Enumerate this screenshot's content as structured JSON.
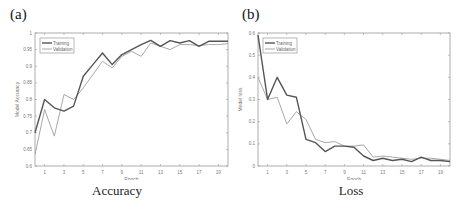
{
  "chart_data": [
    {
      "type": "line",
      "panel_label": "(a)",
      "caption": "Accuracy",
      "title": "",
      "xlabel": "Epoch",
      "ylabel": "Model Accuracy",
      "xlim": [
        0,
        20
      ],
      "ylim": [
        0.6,
        1.0
      ],
      "xticks": [
        1,
        3,
        5,
        7,
        9,
        11,
        13,
        15,
        17,
        19
      ],
      "yticks": [
        0.6,
        0.65,
        0.7,
        0.75,
        0.8,
        0.85,
        0.9,
        0.95,
        1
      ],
      "ytick_labels": [
        "0.6",
        "0.65",
        "0.7",
        "0.75",
        "0.8",
        "0.85",
        "0.9",
        "0.95",
        "1"
      ],
      "grid": false,
      "legend_position": "upper left",
      "x": [
        0,
        1,
        2,
        3,
        4,
        5,
        6,
        7,
        8,
        9,
        10,
        11,
        12,
        13,
        14,
        15,
        16,
        17,
        18,
        19,
        20
      ],
      "series": [
        {
          "name": "Training",
          "color": "#555555",
          "values": [
            0.7,
            0.8,
            0.775,
            0.765,
            0.78,
            0.87,
            0.905,
            0.94,
            0.905,
            0.935,
            0.95,
            0.965,
            0.978,
            0.96,
            0.977,
            0.97,
            0.977,
            0.96,
            0.975,
            0.975,
            0.975
          ]
        },
        {
          "name": "Validation",
          "color": "#a8a8a8",
          "values": [
            0.635,
            0.77,
            0.69,
            0.815,
            0.8,
            0.835,
            0.875,
            0.915,
            0.895,
            0.93,
            0.945,
            0.93,
            0.97,
            0.96,
            0.95,
            0.965,
            0.965,
            0.962,
            0.965,
            0.965,
            0.968
          ]
        }
      ]
    },
    {
      "type": "line",
      "panel_label": "(b)",
      "caption": "Loss",
      "title": "",
      "xlabel": "Epoch",
      "ylabel": "Model loss",
      "xlim": [
        0,
        20
      ],
      "ylim": [
        0,
        0.6
      ],
      "xticks": [
        1,
        3,
        5,
        7,
        9,
        11,
        13,
        15,
        17,
        19
      ],
      "yticks": [
        0,
        0.1,
        0.2,
        0.3,
        0.4,
        0.5,
        0.6
      ],
      "ytick_labels": [
        "0",
        "0.1",
        "0.2",
        "0.3",
        "0.4",
        "0.5",
        "0.6"
      ],
      "grid": false,
      "legend_position": "upper left",
      "x": [
        0,
        1,
        2,
        3,
        4,
        5,
        6,
        7,
        8,
        9,
        10,
        11,
        12,
        13,
        14,
        15,
        16,
        17,
        18,
        19,
        20
      ],
      "series": [
        {
          "name": "Training",
          "color": "#555555",
          "values": [
            0.59,
            0.3,
            0.4,
            0.32,
            0.31,
            0.12,
            0.105,
            0.065,
            0.09,
            0.09,
            0.085,
            0.045,
            0.025,
            0.035,
            0.025,
            0.03,
            0.02,
            0.04,
            0.025,
            0.025,
            0.02
          ]
        },
        {
          "name": "Validation",
          "color": "#a8a8a8",
          "values": [
            0.4,
            0.3,
            0.31,
            0.19,
            0.245,
            0.21,
            0.12,
            0.105,
            0.11,
            0.09,
            0.09,
            0.095,
            0.04,
            0.045,
            0.04,
            0.035,
            0.03,
            0.035,
            0.035,
            0.03,
            0.025
          ]
        }
      ]
    }
  ]
}
